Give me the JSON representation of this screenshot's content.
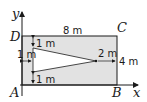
{
  "diagram": {
    "points": {
      "A": "A",
      "B": "B",
      "C": "C",
      "D": "D"
    },
    "axes": {
      "x": "x",
      "y": "y"
    },
    "dimensions": {
      "top_width": "8 m",
      "top_gap": "1 m",
      "left_gap": "1 m",
      "bottom_gap": "1 m",
      "apex_gap": "2 m",
      "right_height": "4 m"
    },
    "colors": {
      "rectangle_fill": "#e2e2e2",
      "triangle_fill": "#ffffff",
      "stroke": "#1a1a1a"
    }
  }
}
